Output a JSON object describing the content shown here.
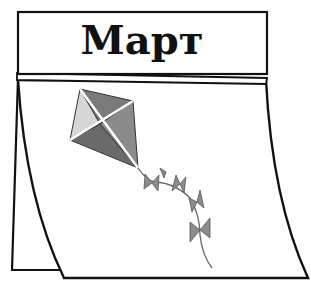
{
  "calendar": {
    "month": "Март",
    "header_bg": "#ffffff",
    "outline_color": "#111111"
  },
  "illustration": {
    "subject": "kite",
    "kite_colors": {
      "top_right": "#7a7a7a",
      "left": "#d6d6d6",
      "bottom_left": "#6a6a6a",
      "bottom_right": "#8a8a8a",
      "spars": "#ffffff"
    },
    "tail_bows": 5,
    "bow_color": "#8c8c8c"
  }
}
